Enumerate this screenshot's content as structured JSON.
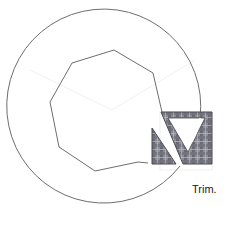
{
  "diagram": {
    "caption": "Trim.",
    "colors": {
      "outline": "#6e6e6e",
      "hatch_dark": "#5a5a66",
      "hatch_mid": "#8a8a94",
      "hatch_light": "#c4c4cc",
      "guide": "#e6e6e6",
      "background": "#ffffff"
    },
    "shapes": {
      "outer_arc": "open circular arc, center approx (112,110), radius approx 97",
      "inner_polygon": "irregular heptagon-like closed/open outline",
      "trim_region": "hatched rectangle with V-shaped notch and separate left triangle"
    }
  }
}
